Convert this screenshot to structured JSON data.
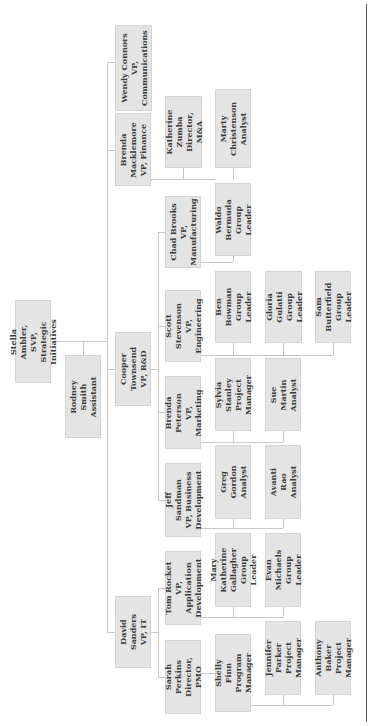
{
  "chart_data": {
    "type": "org-chart",
    "orientation": "rotated-90-ccw",
    "nodes": [
      {
        "id": "stella",
        "name": "Stella Ambler, SVP,",
        "title": "Strategic Initiatives",
        "parent": null,
        "box": [
          15,
          300,
          36,
          83
        ]
      },
      {
        "id": "rodney",
        "name": "Rodney Smith",
        "title": "Assistant",
        "parent": "stella",
        "box": [
          65,
          355,
          36,
          83
        ]
      },
      {
        "id": "wendy",
        "name": "Wendy Connors",
        "title": "VP, Communications",
        "parent": "stella",
        "box": [
          115,
          25,
          37,
          86
        ]
      },
      {
        "id": "brendam",
        "name": "Brenda\nMacklemore",
        "title": "VP, Finance",
        "parent": "stella",
        "box": [
          115,
          113,
          36,
          73
        ]
      },
      {
        "id": "cooper",
        "name": "Cooper Townsend",
        "title": "VP, R&D",
        "parent": "stella",
        "box": [
          115,
          332,
          36,
          74
        ]
      },
      {
        "id": "david",
        "name": "David Sanders",
        "title": "VP, IT",
        "parent": "stella",
        "box": [
          115,
          596,
          36,
          72
        ]
      },
      {
        "id": "katherine",
        "name": "Katherine Zumba",
        "title": "Director, M&A",
        "parent": "brendam",
        "box": [
          165,
          96,
          37,
          72
        ]
      },
      {
        "id": "chad",
        "name": "Chad Brooks",
        "title": "VP, Manufacturing",
        "parent": "cooper",
        "box": [
          165,
          196,
          36,
          72
        ]
      },
      {
        "id": "scott",
        "name": "Scott Stevenson",
        "title": "VP, Engineering",
        "parent": "cooper",
        "box": [
          165,
          290,
          36,
          72
        ]
      },
      {
        "id": "brendap",
        "name": "Brenda Peterson",
        "title": "VP, Marketing",
        "parent": "cooper",
        "box": [
          165,
          376,
          36,
          73
        ]
      },
      {
        "id": "jeff",
        "name": "Jeff Sandman",
        "title": "VP, Business\nDevelopment",
        "parent": "cooper",
        "box": [
          165,
          463,
          36,
          74
        ]
      },
      {
        "id": "tom",
        "name": "Tom Rocket",
        "title": "VP, Application\nDevelopment",
        "parent": "david",
        "box": [
          165,
          551,
          36,
          74
        ]
      },
      {
        "id": "sarah",
        "name": "Sarah Perkins",
        "title": "Director, PMO",
        "parent": "david",
        "box": [
          165,
          640,
          36,
          74
        ]
      },
      {
        "id": "marty",
        "name": "Marty Christenson",
        "title": "Analyst",
        "parent": "katherine",
        "box": [
          215,
          89,
          36,
          79
        ]
      },
      {
        "id": "waldo",
        "name": "Waldo Bermuda",
        "title": "Group Leader",
        "parent": "chad",
        "box": [
          215,
          183,
          36,
          73
        ]
      },
      {
        "id": "ben",
        "name": "Ben Bowman",
        "title": "Group Leader",
        "parent": "scott",
        "box": [
          215,
          271,
          36,
          72
        ]
      },
      {
        "id": "gloria",
        "name": "Gloria Gulatti",
        "title": "Group Leader",
        "parent": "scott",
        "box": [
          265,
          271,
          37,
          72
        ]
      },
      {
        "id": "sam",
        "name": "Sam Butterfield",
        "title": "Group Leader",
        "parent": "scott",
        "box": [
          315,
          271,
          36,
          72
        ]
      },
      {
        "id": "sylvia",
        "name": "Sylvia Stanley",
        "title": "Project Manager",
        "parent": "brendap",
        "box": [
          215,
          358,
          36,
          73
        ]
      },
      {
        "id": "sue",
        "name": "Sue Martin",
        "title": "Analyst",
        "parent": "brendap",
        "box": [
          265,
          358,
          36,
          73
        ]
      },
      {
        "id": "greg",
        "name": "Greg Gordon",
        "title": "Analyst",
        "parent": "jeff",
        "box": [
          215,
          445,
          36,
          74
        ]
      },
      {
        "id": "avanti",
        "name": "Avanti Rao",
        "title": "Analyst",
        "parent": "jeff",
        "box": [
          265,
          445,
          36,
          74
        ]
      },
      {
        "id": "mary",
        "name": "Mary Katherine\nGallagher",
        "title": "Group Leader",
        "parent": "tom",
        "box": [
          215,
          533,
          36,
          74
        ]
      },
      {
        "id": "evan",
        "name": "Evan Michaels",
        "title": "Group Leader",
        "parent": "tom",
        "box": [
          265,
          533,
          36,
          74
        ]
      },
      {
        "id": "shelly",
        "name": "Shelly Finn",
        "title": "Program Manager",
        "parent": "sarah",
        "box": [
          215,
          634,
          36,
          78
        ]
      },
      {
        "id": "jennifer",
        "name": "Jennifer Parker",
        "title": "Project Manager",
        "parent": "sarah",
        "box": [
          265,
          621,
          36,
          74
        ]
      },
      {
        "id": "anthony",
        "name": "Anthony Baker",
        "title": "Project Manager",
        "parent": "sarah",
        "box": [
          315,
          621,
          36,
          74
        ]
      }
    ],
    "lines": [
      [
        51,
        341,
        107,
        341
      ],
      [
        83,
        341,
        83,
        355
      ],
      [
        107,
        62,
        107,
        632
      ],
      [
        107,
        62,
        115,
        62
      ],
      [
        107,
        150,
        115,
        150
      ],
      [
        107,
        369,
        115,
        369
      ],
      [
        107,
        632,
        115,
        632
      ],
      [
        151,
        180,
        151,
        180
      ],
      [
        151,
        179,
        216,
        179
      ],
      [
        183,
        168,
        183,
        179
      ],
      [
        233,
        168,
        233,
        179
      ],
      [
        151,
        369,
        158,
        369
      ],
      [
        158,
        232,
        158,
        500
      ],
      [
        158,
        232,
        165,
        232
      ],
      [
        158,
        326,
        165,
        326
      ],
      [
        158,
        412,
        165,
        412
      ],
      [
        158,
        500,
        165,
        500
      ],
      [
        151,
        632,
        158,
        632
      ],
      [
        158,
        588,
        158,
        677
      ],
      [
        158,
        588,
        165,
        588
      ],
      [
        158,
        677,
        165,
        677
      ],
      [
        201,
        262,
        233,
        262
      ],
      [
        233,
        256,
        233,
        262
      ],
      [
        201,
        355,
        333,
        355
      ],
      [
        233,
        343,
        233,
        355
      ],
      [
        283,
        343,
        283,
        355
      ],
      [
        333,
        343,
        333,
        355
      ],
      [
        201,
        442,
        283,
        442
      ],
      [
        233,
        431,
        233,
        442
      ],
      [
        283,
        431,
        283,
        442
      ],
      [
        201,
        528,
        283,
        528
      ],
      [
        233,
        519,
        233,
        528
      ],
      [
        283,
        519,
        283,
        528
      ],
      [
        201,
        617,
        283,
        617
      ],
      [
        233,
        607,
        233,
        617
      ],
      [
        283,
        607,
        283,
        617
      ],
      [
        201,
        673,
        215,
        673
      ],
      [
        251,
        705,
        333,
        705
      ],
      [
        283,
        695,
        283,
        705
      ],
      [
        333,
        695,
        333,
        705
      ]
    ]
  }
}
